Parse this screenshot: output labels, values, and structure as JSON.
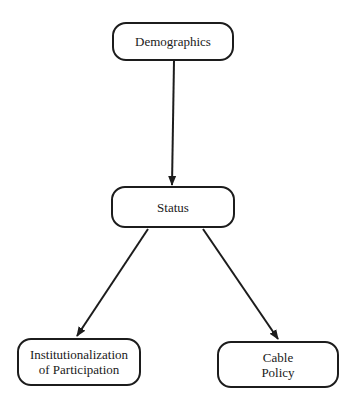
{
  "diagram": {
    "type": "flowchart",
    "nodes": [
      {
        "id": "demographics",
        "label": "Demographics"
      },
      {
        "id": "status",
        "label": "Status"
      },
      {
        "id": "institutionalization",
        "label": "Institutionalization\nof Participation"
      },
      {
        "id": "cable_policy",
        "label": "Cable\nPolicy"
      }
    ],
    "edges": [
      {
        "from": "demographics",
        "to": "status"
      },
      {
        "from": "status",
        "to": "institutionalization"
      },
      {
        "from": "status",
        "to": "cable_policy"
      }
    ],
    "colors": {
      "stroke": "#1c1c1c",
      "background": "#ffffff",
      "text": "#1a1a1a"
    }
  }
}
